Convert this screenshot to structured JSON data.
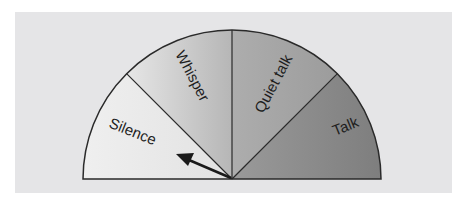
{
  "diagram": {
    "type": "semicircular-gauge",
    "segments": [
      {
        "label": "Silence",
        "order": 1,
        "color": "#ececec"
      },
      {
        "label": "Whisper",
        "order": 2,
        "color": "#c4c4c4"
      },
      {
        "label": "Quiet talk",
        "order": 3,
        "color": "#a6a6a6"
      },
      {
        "label": "Talk",
        "order": 4,
        "color": "#8c8c8c"
      }
    ],
    "pointer": {
      "points_to": "Silence",
      "angle_deg": 152
    },
    "colors": {
      "panel": "#e5e5e7",
      "outline": "#2a2a2a"
    }
  }
}
